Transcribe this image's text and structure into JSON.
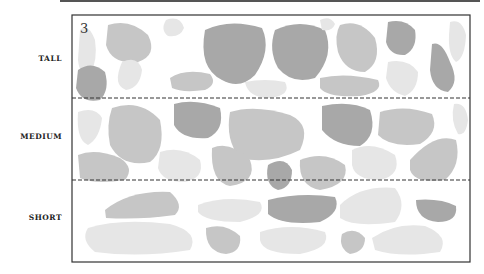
{
  "figure": {
    "number": "3",
    "rows": [
      {
        "label": "TALL"
      },
      {
        "label": "MEDIUM"
      },
      {
        "label": "SHORT"
      }
    ]
  },
  "colors": {
    "dark": "#a8a8a8",
    "mid": "#c6c6c6",
    "light": "#e6e6e6",
    "frame": "#333333"
  }
}
